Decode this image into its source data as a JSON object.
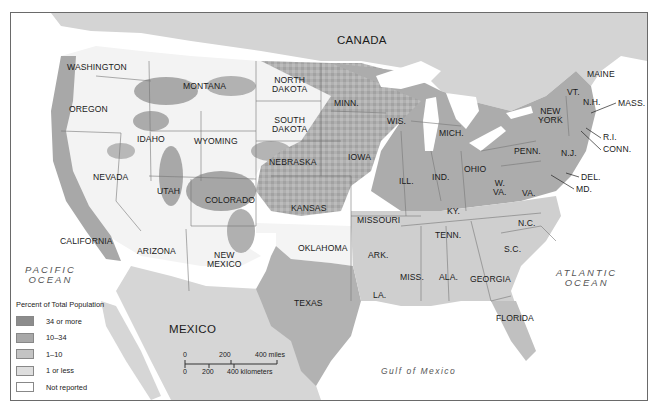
{
  "map": {
    "type": "choropleth",
    "subject": "Percent of Total Population",
    "countries": [
      "CANADA",
      "MEXICO"
    ],
    "oceans": [
      {
        "name": "PACIFIC OCEAN",
        "lines": [
          "PACIFIC",
          "OCEAN"
        ]
      },
      {
        "name": "ATLANTIC OCEAN",
        "lines": [
          "ATLANTIC",
          "OCEAN"
        ]
      },
      {
        "name": "Gulf of Mexico"
      }
    ],
    "states": {
      "washington": "WASHINGTON",
      "oregon": "OREGON",
      "california": "CALIFORNIA",
      "nevada": "NEVADA",
      "idaho": "IDAHO",
      "montana": "MONTANA",
      "wyoming": "WYOMING",
      "utah": "UTAH",
      "arizona": "ARIZONA",
      "colorado": "COLORADO",
      "new_mexico_1": "NEW",
      "new_mexico_2": "MEXICO",
      "north_dakota_1": "NORTH",
      "north_dakota_2": "DAKOTA",
      "south_dakota_1": "SOUTH",
      "south_dakota_2": "DAKOTA",
      "nebraska": "NEBRASKA",
      "kansas": "KANSAS",
      "oklahoma": "OKLAHOMA",
      "texas": "TEXAS",
      "minn": "MINN.",
      "iowa": "IOWA",
      "missouri": "MISSOURI",
      "ark": "ARK.",
      "la": "LA.",
      "wis": "WIS.",
      "ill": "ILL.",
      "mich": "MICH.",
      "ind": "IND.",
      "ohio": "OHIO",
      "ky": "KY.",
      "tenn": "TENN.",
      "miss": "MISS.",
      "ala": "ALA.",
      "georgia": "GEORGIA",
      "florida": "FLORIDA",
      "sc": "S.C.",
      "nc": "N.C.",
      "va": "VA.",
      "wva_1": "W.",
      "wva_2": "VA.",
      "penn": "PENN.",
      "new_york_1": "NEW",
      "new_york_2": "YORK",
      "nj": "N.J.",
      "del": "DEL.",
      "md": "MD.",
      "conn": "CONN.",
      "ri": "R.I.",
      "mass": "MASS.",
      "vt": "VT.",
      "nh": "N.H.",
      "maine": "MAINE"
    },
    "legend": {
      "title": "Percent of Total Population",
      "items": [
        {
          "label": "34 or more",
          "color": "#8c8c8c"
        },
        {
          "label": "10–34",
          "color": "#a8a8a8"
        },
        {
          "label": "1–10",
          "color": "#c4c4c4"
        },
        {
          "label": "1 or less",
          "color": "#dedede"
        },
        {
          "label": "Not reported",
          "color": "#ffffff"
        }
      ]
    },
    "scale_bar": {
      "miles": [
        "0",
        "200",
        "400 miles"
      ],
      "kilometers": [
        "0",
        "200",
        "400 kilometers"
      ]
    },
    "colors": {
      "water": "#ffffff",
      "foreign_land": "#d2d2d2",
      "border": "#6a6a6a"
    }
  }
}
